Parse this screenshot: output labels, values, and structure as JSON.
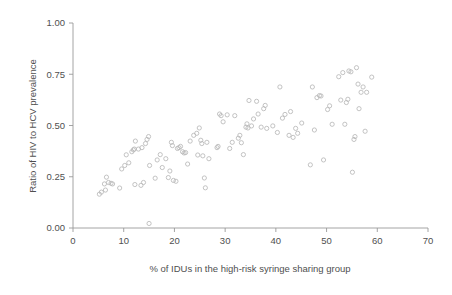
{
  "chart_data": {
    "type": "scatter",
    "title": "",
    "xlabel": "% of IDUs in the high-risk syringe sharing group",
    "ylabel": "Ratio of HIV to HCV prevalence",
    "xlim": [
      0,
      70
    ],
    "ylim": [
      0.0,
      1.0
    ],
    "xticks": [
      0,
      10,
      20,
      30,
      40,
      50,
      60,
      70
    ],
    "xtick_labels": [
      "0",
      "10",
      "20",
      "30",
      "40",
      "50",
      "60",
      "70"
    ],
    "yticks": [
      0.0,
      0.25,
      0.5,
      0.75,
      1.0
    ],
    "ytick_labels": [
      "0.00",
      "0.25",
      "0.50",
      "0.75",
      "1.00"
    ],
    "grid": false,
    "legend": false,
    "legend_position": "none",
    "marker": "open-circle",
    "marker_color": "#b8b8b8",
    "axis_color": "#9a9a9a",
    "text_color": "#4f4f4f",
    "background_color": "#ffffff",
    "n_points": 140,
    "points": [
      [
        5.2,
        0.165
      ],
      [
        5.6,
        0.175
      ],
      [
        6.2,
        0.215
      ],
      [
        6.4,
        0.185
      ],
      [
        6.6,
        0.248
      ],
      [
        7.0,
        0.222
      ],
      [
        7.5,
        0.218
      ],
      [
        7.8,
        0.215
      ],
      [
        9.2,
        0.195
      ],
      [
        9.6,
        0.288
      ],
      [
        10.2,
        0.305
      ],
      [
        10.5,
        0.357
      ],
      [
        11.0,
        0.318
      ],
      [
        11.6,
        0.372
      ],
      [
        11.9,
        0.381
      ],
      [
        12.1,
        0.385
      ],
      [
        12.3,
        0.424
      ],
      [
        12.2,
        0.212
      ],
      [
        12.9,
        0.385
      ],
      [
        13.4,
        0.208
      ],
      [
        13.6,
        0.392
      ],
      [
        13.9,
        0.222
      ],
      [
        14.3,
        0.412
      ],
      [
        14.6,
        0.432
      ],
      [
        14.9,
        0.446
      ],
      [
        15.0,
        0.022
      ],
      [
        15.1,
        0.305
      ],
      [
        16.2,
        0.243
      ],
      [
        16.6,
        0.332
      ],
      [
        17.2,
        0.358
      ],
      [
        17.6,
        0.295
      ],
      [
        18.3,
        0.338
      ],
      [
        18.8,
        0.246
      ],
      [
        19.1,
        0.278
      ],
      [
        19.4,
        0.418
      ],
      [
        19.6,
        0.402
      ],
      [
        19.8,
        0.232
      ],
      [
        20.3,
        0.228
      ],
      [
        20.6,
        0.388
      ],
      [
        20.9,
        0.392
      ],
      [
        21.2,
        0.398
      ],
      [
        21.6,
        0.372
      ],
      [
        21.9,
        0.366
      ],
      [
        22.2,
        0.368
      ],
      [
        22.6,
        0.312
      ],
      [
        23.1,
        0.424
      ],
      [
        23.8,
        0.452
      ],
      [
        24.4,
        0.462
      ],
      [
        24.6,
        0.356
      ],
      [
        24.9,
        0.488
      ],
      [
        25.2,
        0.428
      ],
      [
        25.4,
        0.412
      ],
      [
        25.6,
        0.352
      ],
      [
        25.9,
        0.244
      ],
      [
        26.1,
        0.196
      ],
      [
        26.4,
        0.418
      ],
      [
        26.8,
        0.338
      ],
      [
        28.4,
        0.392
      ],
      [
        28.6,
        0.398
      ],
      [
        28.9,
        0.556
      ],
      [
        29.2,
        0.548
      ],
      [
        29.6,
        0.518
      ],
      [
        30.4,
        0.552
      ],
      [
        30.9,
        0.388
      ],
      [
        31.4,
        0.418
      ],
      [
        31.9,
        0.548
      ],
      [
        32.6,
        0.438
      ],
      [
        32.9,
        0.452
      ],
      [
        33.2,
        0.416
      ],
      [
        33.6,
        0.358
      ],
      [
        34.1,
        0.492
      ],
      [
        34.3,
        0.508
      ],
      [
        34.5,
        0.488
      ],
      [
        34.7,
        0.622
      ],
      [
        35.2,
        0.498
      ],
      [
        35.6,
        0.532
      ],
      [
        36.2,
        0.618
      ],
      [
        36.5,
        0.556
      ],
      [
        37.1,
        0.492
      ],
      [
        37.6,
        0.582
      ],
      [
        37.9,
        0.598
      ],
      [
        38.2,
        0.486
      ],
      [
        39.4,
        0.498
      ],
      [
        40.3,
        0.466
      ],
      [
        40.8,
        0.688
      ],
      [
        41.3,
        0.536
      ],
      [
        41.8,
        0.554
      ],
      [
        42.6,
        0.452
      ],
      [
        42.9,
        0.568
      ],
      [
        43.4,
        0.442
      ],
      [
        43.9,
        0.486
      ],
      [
        44.3,
        0.462
      ],
      [
        45.1,
        0.512
      ],
      [
        46.8,
        0.308
      ],
      [
        47.2,
        0.688
      ],
      [
        47.6,
        0.478
      ],
      [
        48.1,
        0.636
      ],
      [
        48.6,
        0.646
      ],
      [
        48.9,
        0.644
      ],
      [
        49.4,
        0.332
      ],
      [
        50.2,
        0.578
      ],
      [
        50.6,
        0.596
      ],
      [
        51.1,
        0.506
      ],
      [
        52.4,
        0.738
      ],
      [
        52.8,
        0.624
      ],
      [
        53.2,
        0.758
      ],
      [
        53.6,
        0.506
      ],
      [
        53.9,
        0.612
      ],
      [
        54.2,
        0.628
      ],
      [
        54.4,
        0.766
      ],
      [
        54.8,
        0.762
      ],
      [
        55.1,
        0.272
      ],
      [
        55.4,
        0.432
      ],
      [
        55.6,
        0.446
      ],
      [
        55.9,
        0.782
      ],
      [
        56.2,
        0.702
      ],
      [
        56.4,
        0.582
      ],
      [
        56.8,
        0.662
      ],
      [
        57.2,
        0.688
      ],
      [
        57.6,
        0.472
      ],
      [
        57.9,
        0.662
      ],
      [
        58.9,
        0.736
      ]
    ]
  }
}
